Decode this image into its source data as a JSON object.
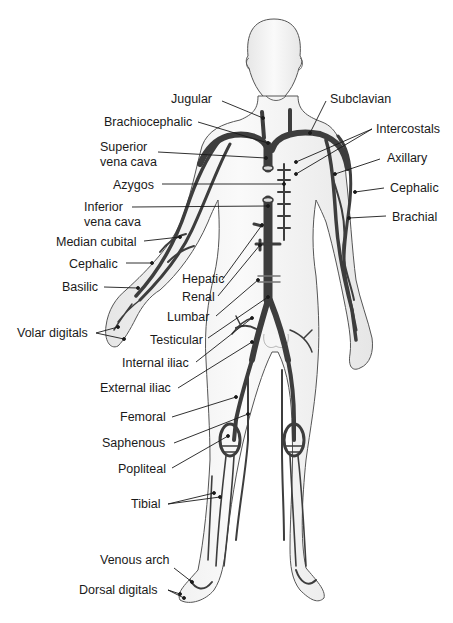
{
  "figure": {
    "colors": {
      "vein": "#3d3d3d",
      "body_fill": "#f2f2f2",
      "outline": "#555555",
      "shade": "#d8d8d8",
      "text": "#1a1a1a"
    }
  },
  "labels": {
    "left": [
      {
        "id": "jugular",
        "text": "Jugular",
        "x": 171,
        "y": 92
      },
      {
        "id": "brachiocephalic",
        "text": "Brachiocephalic",
        "x": 104,
        "y": 115
      },
      {
        "id": "superior_vena_cava_1",
        "text": "Superior",
        "x": 100,
        "y": 140
      },
      {
        "id": "superior_vena_cava_2",
        "text": "vena cava",
        "x": 100,
        "y": 155
      },
      {
        "id": "azygos",
        "text": "Azygos",
        "x": 113,
        "y": 178
      },
      {
        "id": "inferior_vena_cava_1",
        "text": "Inferior",
        "x": 84,
        "y": 200
      },
      {
        "id": "inferior_vena_cava_2",
        "text": "vena cava",
        "x": 84,
        "y": 215
      },
      {
        "id": "median_cubital",
        "text": "Median cubital",
        "x": 56,
        "y": 235
      },
      {
        "id": "cephalic_left",
        "text": "Cephalic",
        "x": 69,
        "y": 257
      },
      {
        "id": "basilic",
        "text": "Basilic",
        "x": 62,
        "y": 280
      },
      {
        "id": "hepatic",
        "text": "Hepatic",
        "x": 182,
        "y": 272
      },
      {
        "id": "renal",
        "text": "Renal",
        "x": 182,
        "y": 290
      },
      {
        "id": "lumbar",
        "text": "Lumbar",
        "x": 167,
        "y": 310
      },
      {
        "id": "volar_digitals",
        "text": "Volar digitals",
        "x": 17,
        "y": 326
      },
      {
        "id": "testicular",
        "text": "Testicular",
        "x": 150,
        "y": 333
      },
      {
        "id": "internal_iliac",
        "text": "Internal iliac",
        "x": 122,
        "y": 356
      },
      {
        "id": "external_iliac",
        "text": "External iliac",
        "x": 100,
        "y": 381
      },
      {
        "id": "femoral",
        "text": "Femoral",
        "x": 120,
        "y": 410
      },
      {
        "id": "saphenous",
        "text": "Saphenous",
        "x": 102,
        "y": 436
      },
      {
        "id": "popliteal",
        "text": "Popliteal",
        "x": 118,
        "y": 462
      },
      {
        "id": "tibial",
        "text": "Tibial",
        "x": 131,
        "y": 497
      },
      {
        "id": "venous_arch",
        "text": "Venous arch",
        "x": 100,
        "y": 553
      },
      {
        "id": "dorsal_digitals",
        "text": "Dorsal digitals",
        "x": 79,
        "y": 583
      }
    ],
    "right": [
      {
        "id": "subclavian",
        "text": "Subclavian",
        "x": 330,
        "y": 92
      },
      {
        "id": "intercostals",
        "text": "Intercostals",
        "x": 376,
        "y": 122
      },
      {
        "id": "axillary",
        "text": "Axillary",
        "x": 387,
        "y": 151
      },
      {
        "id": "cephalic_right",
        "text": "Cephalic",
        "x": 390,
        "y": 181
      },
      {
        "id": "brachial",
        "text": "Brachial",
        "x": 392,
        "y": 210
      }
    ]
  }
}
